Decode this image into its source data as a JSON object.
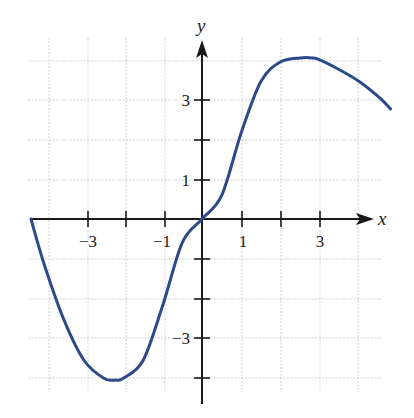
{
  "chart_data": {
    "type": "line",
    "title": "",
    "xlabel": "x",
    "ylabel": "y",
    "xlim": [
      -4.4,
      4.8
    ],
    "ylim": [
      -4.6,
      4.5
    ],
    "grid": true,
    "x_tick_labels": [
      "-3",
      "-1",
      "1",
      "3"
    ],
    "y_tick_labels": [
      "3",
      "1",
      "-3"
    ],
    "x_ticks": [
      -3,
      -2,
      -1,
      1,
      2,
      3
    ],
    "y_ticks": [
      -4,
      -3,
      -2,
      -1,
      1,
      2,
      3
    ],
    "series": [
      {
        "name": "f(x)",
        "color": "#2c4a8a",
        "x": [
          -4.35,
          -4.0,
          -3.5,
          -3.0,
          -2.5,
          -2.2,
          -2.0,
          -1.5,
          -1.0,
          -0.5,
          0.0,
          0.5,
          1.0,
          1.5,
          2.0,
          2.5,
          2.8,
          3.0,
          3.5,
          4.0,
          4.5,
          4.8
        ],
        "y": [
          0.0,
          -1.2,
          -2.6,
          -3.6,
          -4.05,
          -4.1,
          -4.05,
          -3.6,
          -2.2,
          -0.6,
          0.0,
          0.6,
          2.2,
          3.5,
          4.0,
          4.1,
          4.1,
          4.05,
          3.8,
          3.5,
          3.1,
          2.8
        ]
      }
    ]
  },
  "labels": {
    "x_axis": "x",
    "y_axis": "y",
    "xt_m3": "−3",
    "xt_m1": "−1",
    "xt_1": "1",
    "xt_3": "3",
    "yt_3": "3",
    "yt_1": "1",
    "yt_m3": "−3"
  }
}
